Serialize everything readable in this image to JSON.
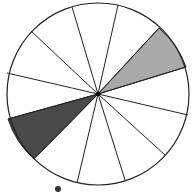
{
  "diagram": {
    "type": "segmented-circle",
    "center": [
      98,
      94
    ],
    "radius": 91,
    "segment_count": 12,
    "spoke_endpoints": [
      [
        118,
        5
      ],
      [
        159,
        28
      ],
      [
        186,
        67
      ],
      [
        188,
        115
      ],
      [
        165,
        155
      ],
      [
        125,
        180
      ],
      [
        77,
        183
      ],
      [
        34,
        159
      ],
      [
        8,
        119
      ],
      [
        7,
        73
      ],
      [
        31,
        31
      ],
      [
        72,
        7
      ]
    ],
    "shaded_segments": [
      {
        "from_spoke": 1,
        "to_spoke": 2,
        "fill": "#a9a9a9",
        "label": "light-gray-segment"
      },
      {
        "from_spoke": 7,
        "to_spoke": 8,
        "fill": "#4a4a4a",
        "label": "dark-gray-segment"
      }
    ],
    "stroke_color": "#222222",
    "background_fill": "#ffffff"
  },
  "caption": {
    "text": "",
    "note": "bottom caption text is cropped and illegible"
  }
}
